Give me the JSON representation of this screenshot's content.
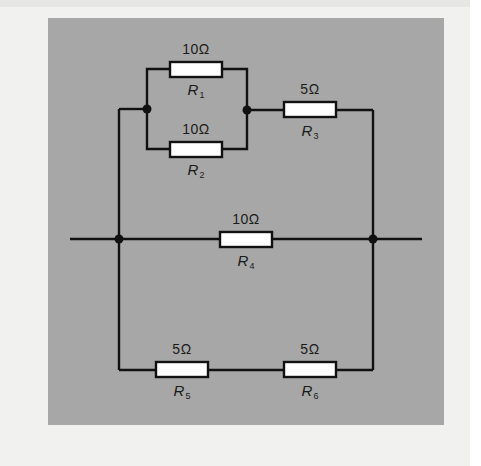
{
  "diagram": {
    "type": "circuit",
    "colors": {
      "page_background": "#f1f1ef",
      "panel_background": "#a7a7a7",
      "wire": "#111111",
      "resistor_fill": "#ffffff"
    },
    "resistors": [
      {
        "id": "R1",
        "letter": "R",
        "index": "1",
        "value": "10Ω"
      },
      {
        "id": "R2",
        "letter": "R",
        "index": "2",
        "value": "10Ω"
      },
      {
        "id": "R3",
        "letter": "R",
        "index": "3",
        "value": "5Ω"
      },
      {
        "id": "R4",
        "letter": "R",
        "index": "4",
        "value": "10Ω"
      },
      {
        "id": "R5",
        "letter": "R",
        "index": "5",
        "value": "5Ω"
      },
      {
        "id": "R6",
        "letter": "R",
        "index": "6",
        "value": "5Ω"
      }
    ],
    "topology": {
      "parallel_groups": [
        [
          "R1",
          "R2"
        ]
      ],
      "series_branches": [
        [
          "R1||R2",
          "R3"
        ],
        [
          "R4"
        ],
        [
          "R5",
          "R6"
        ]
      ],
      "branches_in_parallel_between_main_nodes": 3
    }
  }
}
